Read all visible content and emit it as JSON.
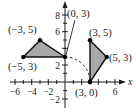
{
  "figure": {
    "type": "coordinate-plane-diagram",
    "axes": {
      "x_label": "x",
      "x_ticks": [
        {
          "value": -6,
          "label": "−6"
        },
        {
          "value": -4,
          "label": "−4"
        },
        {
          "value": -2,
          "label": "−2"
        },
        {
          "value": 2,
          "label": ""
        },
        {
          "value": 4,
          "label": ""
        },
        {
          "value": 6,
          "label": "6"
        }
      ],
      "y_ticks": [
        {
          "value": -2,
          "label": "−2"
        },
        {
          "value": 2,
          "label": "2"
        },
        {
          "value": 6,
          "label": "6"
        },
        {
          "value": 8,
          "label": "8"
        }
      ]
    },
    "shapes": {
      "left_triangle": {
        "vertices": [
          [
            -5,
            3
          ],
          [
            -3,
            5
          ],
          [
            0,
            3
          ]
        ],
        "fill": "#a8a8a8"
      },
      "right_triangle": {
        "vertices": [
          [
            3,
            5
          ],
          [
            5,
            3
          ],
          [
            3,
            0
          ]
        ],
        "fill": "#a8a8a8"
      }
    },
    "point_labels": {
      "p_m5_3": "(−5, 3)",
      "p_m3_5": "(−3, 5)",
      "p_0_3": "(0, 3)",
      "p_3_5": "(3, 5)",
      "p_5_3": "(5, 3)",
      "p_3_0": "(3, 0)"
    },
    "rotation_arc": {
      "from": [
        0,
        3
      ],
      "to": [
        3,
        0
      ],
      "style": "dashed"
    }
  }
}
